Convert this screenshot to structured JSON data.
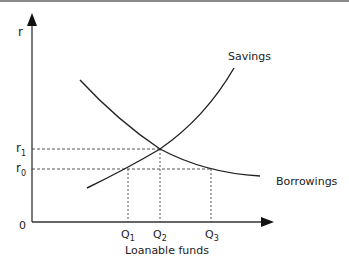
{
  "diagram": {
    "type": "loanable-funds-market",
    "y_axis_label": "r",
    "x_axis_label": "Loanable funds",
    "origin_label": "0",
    "curves": [
      {
        "name": "Savings",
        "direction": "upward-sloping"
      },
      {
        "name": "Borrowings",
        "direction": "downward-sloping"
      }
    ],
    "y_markers": [
      {
        "label": "r",
        "subscript": "1",
        "note": "equilibrium rate"
      },
      {
        "label": "r",
        "subscript": "0",
        "note": "lower rate"
      }
    ],
    "x_markers": [
      {
        "label": "Q",
        "subscript": "1"
      },
      {
        "label": "Q",
        "subscript": "2"
      },
      {
        "label": "Q",
        "subscript": "3"
      }
    ],
    "colors": {
      "line": "#222222",
      "dashed": "#555555",
      "frame_top": "#8a8a8a"
    }
  }
}
